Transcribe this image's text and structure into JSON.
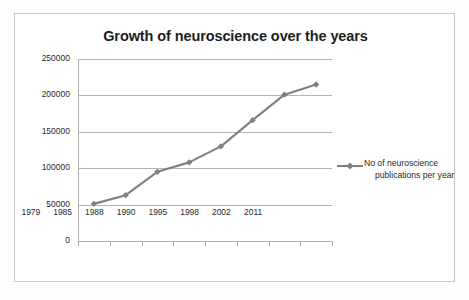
{
  "chart_data": {
    "type": "line",
    "title": "Growth of neuroscience over the years",
    "xlabel": "",
    "ylabel": "",
    "categories": [
      "1979",
      "1985",
      "1988",
      "1990",
      "1995",
      "1998",
      "2002",
      "2011"
    ],
    "series": [
      {
        "name": "No of neuroscience publications per year",
        "values": [
          51000,
          63000,
          95000,
          108000,
          130000,
          166000,
          201000,
          215000
        ],
        "color": "#808080",
        "marker": "diamond"
      }
    ],
    "ylim": [
      0,
      250000
    ],
    "yticks": [
      0,
      50000,
      100000,
      150000,
      200000,
      250000
    ],
    "ytick_labels": [
      "0",
      "50000",
      "100000",
      "150000",
      "200000",
      "250000"
    ],
    "grid": true,
    "legend_position": "right"
  },
  "legend": {
    "label_line1": "No of neuroscience",
    "label_line2": "publications per year"
  },
  "colors": {
    "series": "#808080",
    "gridline": "#b4b4b4",
    "axis": "#b0b0b0",
    "border": "#c6c6c6",
    "text": "#1d1d1d",
    "background": "#ffffff"
  }
}
